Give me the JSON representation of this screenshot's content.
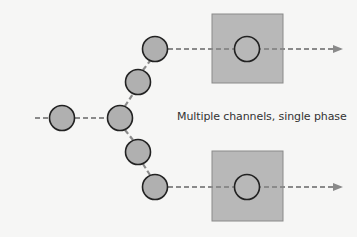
{
  "diagram": {
    "caption": "Multiple channels, single phase",
    "colors": {
      "background": "#f6f6f5",
      "customer_fill": "#b0b0b0",
      "customer_stroke": "#222222",
      "server_fill": "#b8b8b8",
      "server_stroke": "#8a8a8a",
      "flow_line": "#8a8a8a"
    },
    "queue_top": [
      "customer",
      "customer"
    ],
    "queue_bottom": [
      "customer",
      "customer"
    ],
    "channels": [
      {
        "name": "channel-1",
        "label": ""
      },
      {
        "name": "channel-2",
        "label": ""
      }
    ]
  }
}
